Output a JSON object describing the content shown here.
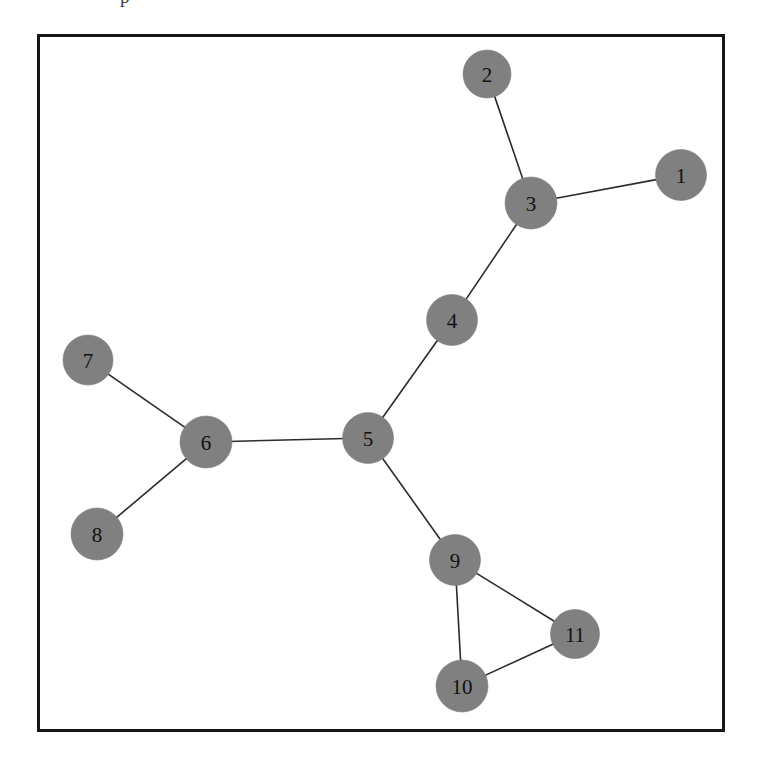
{
  "page": {
    "fragment_text": "p",
    "background_color": "#ffffff"
  },
  "figure": {
    "frame": {
      "x": 37,
      "y": 34,
      "width": 688,
      "height": 698,
      "border_color": "#171717",
      "border_width": 3,
      "fill": "#ffffff"
    },
    "node_fill_color": "#808080",
    "node_label_color": "#111111",
    "edge_color": "#2b2b2b"
  },
  "chart_data": {
    "type": "diagram",
    "graph_type": "undirected-node-link-graph",
    "title": "",
    "xlabel": "",
    "ylabel": "",
    "grid": false,
    "legend": "none",
    "coordinate_space": {
      "description": "pixel coordinates relative to the inner area of the figure frame",
      "width": 682,
      "height": 692
    },
    "node_count": 11,
    "edge_count": 11,
    "nodes": [
      {
        "id": "1",
        "label": "1",
        "x": 641,
        "y": 138,
        "r": 25.5
      },
      {
        "id": "2",
        "label": "2",
        "x": 447,
        "y": 37,
        "r": 24.0
      },
      {
        "id": "3",
        "label": "3",
        "x": 491,
        "y": 166,
        "r": 26.0
      },
      {
        "id": "4",
        "label": "4",
        "x": 412,
        "y": 283,
        "r": 25.5
      },
      {
        "id": "5",
        "label": "5",
        "x": 328,
        "y": 401,
        "r": 25.5
      },
      {
        "id": "6",
        "label": "6",
        "x": 166,
        "y": 405,
        "r": 26.0
      },
      {
        "id": "7",
        "label": "7",
        "x": 48,
        "y": 323,
        "r": 25.0
      },
      {
        "id": "8",
        "label": "8",
        "x": 57,
        "y": 497,
        "r": 26.0
      },
      {
        "id": "9",
        "label": "9",
        "x": 415,
        "y": 523,
        "r": 25.5
      },
      {
        "id": "10",
        "label": "10",
        "x": 422,
        "y": 649,
        "r": 26.0
      },
      {
        "id": "11",
        "label": "11",
        "x": 535,
        "y": 597,
        "r": 24.5
      }
    ],
    "edges": [
      {
        "source": "2",
        "target": "3"
      },
      {
        "source": "3",
        "target": "1"
      },
      {
        "source": "3",
        "target": "4"
      },
      {
        "source": "4",
        "target": "5"
      },
      {
        "source": "5",
        "target": "6"
      },
      {
        "source": "6",
        "target": "7"
      },
      {
        "source": "6",
        "target": "8"
      },
      {
        "source": "5",
        "target": "9"
      },
      {
        "source": "9",
        "target": "10"
      },
      {
        "source": "9",
        "target": "11"
      },
      {
        "source": "10",
        "target": "11"
      }
    ],
    "node_degrees": {
      "1": 1,
      "2": 1,
      "3": 3,
      "4": 2,
      "5": 3,
      "6": 3,
      "7": 1,
      "8": 1,
      "9": 3,
      "10": 2,
      "11": 2
    }
  }
}
